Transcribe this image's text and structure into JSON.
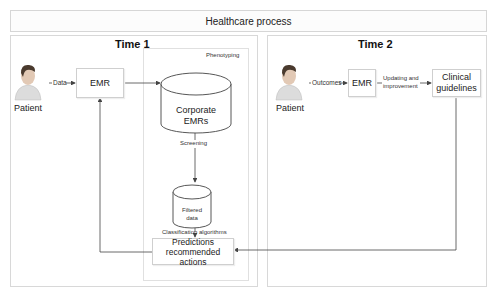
{
  "header": {
    "title": "Healthcare process"
  },
  "time1": {
    "title": "Time 1",
    "patient_label": "Patient",
    "data_arrow_label": "Data",
    "emr_label": "EMR",
    "phenotyping": {
      "title": "Phenotyping",
      "corporate_db_line1": "Corporate",
      "corporate_db_line2": "EMRs",
      "screening_label": "Screening",
      "filtered_db_line1": "Filtered",
      "filtered_db_line2": "data",
      "classification_label": "Classification algorithms",
      "predictions_line1": "Predictions",
      "predictions_line2": "recommended actions"
    }
  },
  "time2": {
    "title": "Time 2",
    "patient_label": "Patient",
    "outcomes_arrow_label": "Outcomes",
    "emr_label": "EMR",
    "updating_label_line1": "Updating and",
    "updating_label_line2": "improvement",
    "guidelines_line1": "Clinical",
    "guidelines_line2": "guidelines"
  },
  "colors": {
    "panel_border": "#d8d8d8",
    "arrow": "#444444",
    "patient_skin": "#d9d9d9",
    "patient_hair": "#4a3a2e"
  }
}
